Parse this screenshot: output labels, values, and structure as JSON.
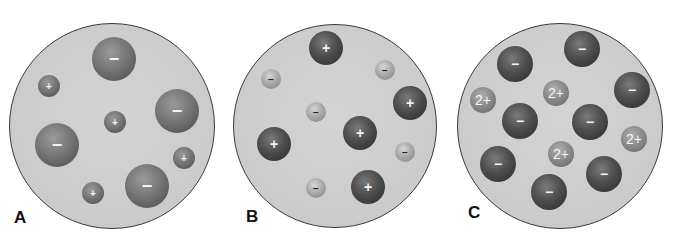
{
  "figure": {
    "panels": [
      {
        "label": "A",
        "cx": 112,
        "cy": 126,
        "r": 103,
        "label_pos": [
          14,
          208
        ],
        "ions": [
          {
            "charge": "−",
            "x": 114,
            "y": 59,
            "r": 22,
            "style": "large-gray"
          },
          {
            "charge": "+",
            "x": 49,
            "y": 86,
            "r": 11,
            "style": "large-gray"
          },
          {
            "charge": "−",
            "x": 177,
            "y": 111,
            "r": 22,
            "style": "large-gray"
          },
          {
            "charge": "+",
            "x": 115,
            "y": 122,
            "r": 11,
            "style": "large-gray"
          },
          {
            "charge": "−",
            "x": 57,
            "y": 145,
            "r": 22,
            "style": "large-gray"
          },
          {
            "charge": "+",
            "x": 184,
            "y": 158,
            "r": 11,
            "style": "large-gray"
          },
          {
            "charge": "−",
            "x": 147,
            "y": 186,
            "r": 22,
            "style": "large-gray"
          },
          {
            "charge": "+",
            "x": 93,
            "y": 193,
            "r": 11,
            "style": "large-gray"
          }
        ]
      },
      {
        "label": "B",
        "cx": 335,
        "cy": 126,
        "r": 102,
        "label_pos": [
          246,
          207
        ],
        "ions": [
          {
            "charge": "+",
            "x": 326,
            "y": 48,
            "r": 17,
            "style": "dark"
          },
          {
            "charge": "−",
            "x": 271,
            "y": 79,
            "r": 10,
            "style": "light"
          },
          {
            "charge": "−",
            "x": 385,
            "y": 70,
            "r": 10,
            "style": "light"
          },
          {
            "charge": "+",
            "x": 410,
            "y": 103,
            "r": 17,
            "style": "dark"
          },
          {
            "charge": "−",
            "x": 316,
            "y": 112,
            "r": 10,
            "style": "light"
          },
          {
            "charge": "+",
            "x": 360,
            "y": 133,
            "r": 17,
            "style": "dark"
          },
          {
            "charge": "+",
            "x": 274,
            "y": 144,
            "r": 17,
            "style": "dark"
          },
          {
            "charge": "−",
            "x": 405,
            "y": 152,
            "r": 10,
            "style": "light"
          },
          {
            "charge": "−",
            "x": 316,
            "y": 188,
            "r": 10,
            "style": "light"
          },
          {
            "charge": "+",
            "x": 368,
            "y": 187,
            "r": 17,
            "style": "dark"
          }
        ]
      },
      {
        "label": "C",
        "cx": 560,
        "cy": 126,
        "r": 103,
        "label_pos": [
          468,
          203
        ],
        "ions": [
          {
            "charge": "−",
            "x": 582,
            "y": 49,
            "r": 18,
            "style": "dark"
          },
          {
            "charge": "−",
            "x": 515,
            "y": 64,
            "r": 18,
            "style": "dark"
          },
          {
            "charge": "2+",
            "x": 483,
            "y": 100,
            "r": 13,
            "style": "mid"
          },
          {
            "charge": "2+",
            "x": 556,
            "y": 93,
            "r": 13,
            "style": "mid"
          },
          {
            "charge": "−",
            "x": 632,
            "y": 90,
            "r": 18,
            "style": "dark"
          },
          {
            "charge": "−",
            "x": 520,
            "y": 121,
            "r": 18,
            "style": "dark"
          },
          {
            "charge": "−",
            "x": 590,
            "y": 122,
            "r": 18,
            "style": "dark"
          },
          {
            "charge": "2+",
            "x": 634,
            "y": 139,
            "r": 13,
            "style": "mid"
          },
          {
            "charge": "2+",
            "x": 561,
            "y": 154,
            "r": 13,
            "style": "mid"
          },
          {
            "charge": "−",
            "x": 498,
            "y": 164,
            "r": 18,
            "style": "dark"
          },
          {
            "charge": "−",
            "x": 604,
            "y": 174,
            "r": 18,
            "style": "dark"
          },
          {
            "charge": "−",
            "x": 549,
            "y": 192,
            "r": 18,
            "style": "dark"
          }
        ]
      }
    ]
  }
}
